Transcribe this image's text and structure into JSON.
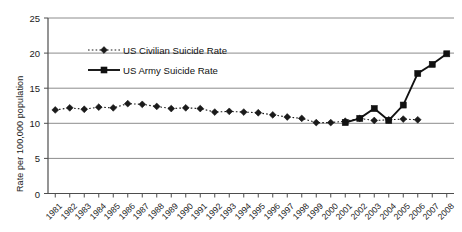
{
  "chart_data": {
    "type": "line",
    "title": "",
    "xlabel": "",
    "ylabel": "Rate per 100,000 population",
    "ylim": [
      0,
      25
    ],
    "yticks": [
      0,
      5,
      10,
      15,
      20,
      25
    ],
    "grid": "horizontal",
    "legend_position": "inside-top-left",
    "categories": [
      "1981",
      "1982",
      "1983",
      "1984",
      "1985",
      "1986",
      "1987",
      "1988",
      "1989",
      "1990",
      "1991",
      "1992",
      "1993",
      "1994",
      "1995",
      "1996",
      "1997",
      "1998",
      "1999",
      "2000",
      "2001",
      "2002",
      "2003",
      "2004",
      "2005",
      "2006",
      "2007",
      "2008"
    ],
    "series": [
      {
        "name": "US Civilian Suicide Rate",
        "marker": "diamond",
        "line_style": "dotted",
        "color": "#1a1a1a",
        "values": [
          11.9,
          12.2,
          12.0,
          12.3,
          12.2,
          12.8,
          12.7,
          12.4,
          12.1,
          12.2,
          12.1,
          11.6,
          11.7,
          11.6,
          11.5,
          11.2,
          10.9,
          10.7,
          10.1,
          10.1,
          10.3,
          10.7,
          10.4,
          10.5,
          10.6,
          10.5,
          null,
          null
        ]
      },
      {
        "name": "US Army Suicide Rate",
        "marker": "square",
        "line_style": "solid",
        "color": "#111111",
        "values": [
          null,
          null,
          null,
          null,
          null,
          null,
          null,
          null,
          null,
          null,
          null,
          null,
          null,
          null,
          null,
          null,
          null,
          null,
          null,
          null,
          10.1,
          10.7,
          12.1,
          10.4,
          12.6,
          17.1,
          18.4,
          19.9
        ]
      }
    ]
  },
  "legend": {
    "items": [
      {
        "label": "US Civilian Suicide Rate",
        "marker": "diamond-icon",
        "style": "dotted"
      },
      {
        "label": "US Army Suicide Rate",
        "marker": "square-icon",
        "style": "solid"
      }
    ]
  },
  "axis": {
    "y_title": "Rate per 100,000 population",
    "y_tick_labels": [
      "0",
      "5",
      "10",
      "15",
      "20",
      "25"
    ],
    "x_tick_labels": [
      "1981",
      "1982",
      "1983",
      "1984",
      "1985",
      "1986",
      "1987",
      "1988",
      "1989",
      "1990",
      "1991",
      "1992",
      "1993",
      "1994",
      "1995",
      "1996",
      "1997",
      "1998",
      "1999",
      "2000",
      "2001",
      "2002",
      "2003",
      "2004",
      "2005",
      "2006",
      "2007",
      "2008"
    ]
  },
  "colors": {
    "axis": "#4d4d4d",
    "gridline": "#8c8c8c",
    "series_civilian": "#1a1a1a",
    "series_army": "#111111",
    "background": "#ffffff"
  }
}
